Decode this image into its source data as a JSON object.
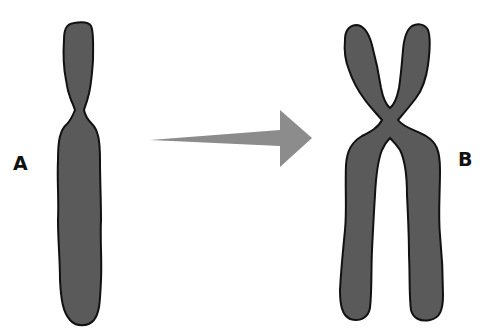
{
  "diagram": {
    "labels": {
      "a": "A",
      "b": "B"
    },
    "colors": {
      "chromosome_fill": "#5a5a5a",
      "chromosome_outline": "#111111",
      "arrow_fill": "#8c8c8c",
      "background": "#ffffff"
    },
    "elements": [
      {
        "id": "chromosome-a",
        "description": "unreplicated chromosome (single chromatid)"
      },
      {
        "id": "arrow",
        "description": "transition arrow pointing right"
      },
      {
        "id": "chromosome-b",
        "description": "replicated chromosome (two sister chromatids joined at centromere)"
      }
    ]
  }
}
